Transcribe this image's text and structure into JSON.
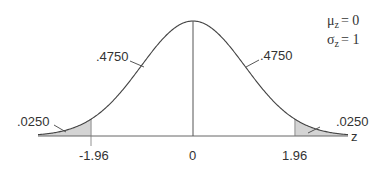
{
  "diagram": {
    "type": "normal-distribution",
    "parameters": {
      "mu_label": "μ",
      "mu_sub": "z",
      "mu_value": "= 0",
      "sigma_label": "σ",
      "sigma_sub": "z",
      "sigma_value": "= 1"
    },
    "axis_label": "z",
    "ticks": [
      {
        "value": -1.96,
        "label": "-1.96"
      },
      {
        "value": 0,
        "label": "0"
      },
      {
        "value": 1.96,
        "label": "1.96"
      }
    ],
    "areas": {
      "left_tail": ".0250",
      "left_center": ".4750",
      "right_center": ".4750",
      "right_tail": ".0250"
    },
    "colors": {
      "curve": "#444444",
      "shade": "#d4d4d4",
      "axis": "#555555"
    }
  }
}
